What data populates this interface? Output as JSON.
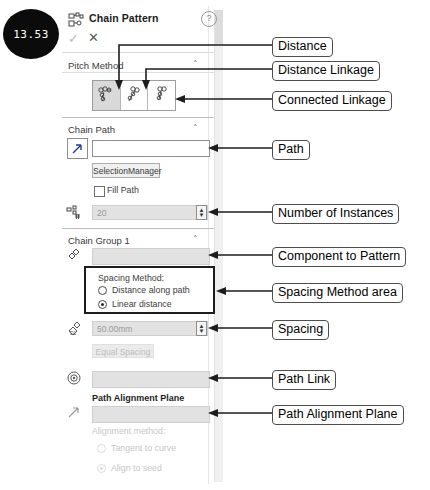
{
  "badge": {
    "label": "13.53"
  },
  "panel": {
    "header": {
      "icon": "chain-pattern-icon",
      "title": "Chain Pattern",
      "help": "?",
      "ok": "✓",
      "cancel": "✕"
    },
    "sections": {
      "pitch_method": {
        "title": "Pitch Method",
        "chevron": "˄",
        "tiles": [
          "distance-pitch-icon",
          "distance-linkage-icon",
          "connected-linkage-icon"
        ],
        "selected_index": 0
      },
      "chain_path": {
        "title": "Chain Path",
        "chevron": "˄",
        "select_button": "path-select-icon",
        "path_value": "",
        "selection_manager": "SelectionManager",
        "fill_path": "Fill Path",
        "instances_icon": "instances-icon",
        "instances_value": "20"
      },
      "chain_group": {
        "title": "Chain Group 1",
        "chevron": "˄",
        "component_icon": "component-icon",
        "component_value": "",
        "spacing_method_title": "Spacing Method:",
        "option_distance_along_path": "Distance along path",
        "option_linear_distance": "Linear distance",
        "selected_option": "Linear distance",
        "spacing_icon": "spacing-icon",
        "spacing_value": "50.00mm",
        "equal_spacing": "Equal Spacing",
        "path_link_icon": "path-link-icon",
        "path_link_value": "",
        "path_alignment_plane_label": "Path Alignment Plane",
        "path_alignment_icon": "path-alignment-icon",
        "path_alignment_value": "",
        "alignment_method_label": "Alignment method:",
        "option_tangent_to_curve": "Tangent to curve",
        "option_align_to_seed": "Align to seed",
        "selected_alignment": "Align to seed"
      }
    }
  },
  "annotations": [
    {
      "id": "distance",
      "label": "Distance"
    },
    {
      "id": "distance-linkage",
      "label": "Distance Linkage"
    },
    {
      "id": "connected-linkage",
      "label": "Connected Linkage"
    },
    {
      "id": "path",
      "label": "Path"
    },
    {
      "id": "number-of-instances",
      "label": "Number of Instances"
    },
    {
      "id": "component-to-pattern",
      "label": "Component to Pattern"
    },
    {
      "id": "spacing-method-area",
      "label": "Spacing Method area"
    },
    {
      "id": "spacing",
      "label": "Spacing"
    },
    {
      "id": "path-link",
      "label": "Path Link"
    },
    {
      "id": "path-alignment-plane",
      "label": "Path Alignment Plane"
    }
  ],
  "colors": {
    "badge_bg": "#0b0b0b",
    "badge_text": "#ffffff",
    "anno_border": "#4d4d4d",
    "panel_bg": "#ffffff",
    "selected_tile": "#d9d9d9",
    "disabled_text": "#c6c6c6"
  }
}
